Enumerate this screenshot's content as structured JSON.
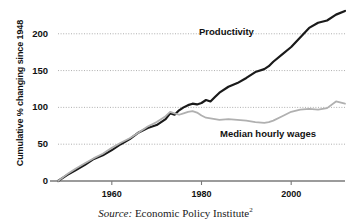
{
  "chart_data": {
    "type": "line",
    "title": "",
    "xlabel": "",
    "ylabel": "Cumulative % changing since 1948",
    "xlim": [
      1948,
      2012
    ],
    "ylim": [
      0,
      235
    ],
    "grid": true,
    "grid_axis": "y",
    "legend_position": "inline-annotation",
    "yticks": [
      0,
      50,
      100,
      150,
      200
    ],
    "ytick_labels": [
      "0",
      "50",
      "100",
      "150",
      "200"
    ],
    "xticks": [
      1960,
      1980,
      2000
    ],
    "xtick_labels": [
      "1960",
      "1980",
      "2000"
    ],
    "series": [
      {
        "name": "Productivity",
        "color": "#1a1a1a",
        "width": 2.2,
        "x": [
          1948,
          1950,
          1952,
          1954,
          1956,
          1958,
          1960,
          1962,
          1964,
          1966,
          1968,
          1970,
          1972,
          1973,
          1974,
          1975,
          1976,
          1977,
          1978,
          1979,
          1980,
          1981,
          1982,
          1983,
          1984,
          1986,
          1988,
          1990,
          1992,
          1994,
          1995,
          1996,
          1998,
          2000,
          2002,
          2004,
          2006,
          2008,
          2010,
          2012
        ],
        "values": [
          0,
          8,
          15,
          22,
          30,
          35,
          42,
          50,
          57,
          66,
          72,
          76,
          84,
          92,
          90,
          96,
          100,
          103,
          105,
          104,
          106,
          110,
          108,
          114,
          120,
          128,
          133,
          140,
          148,
          152,
          156,
          162,
          172,
          182,
          195,
          208,
          215,
          218,
          226,
          231
        ]
      },
      {
        "name": "Median hourly wages",
        "color": "#b0b0b0",
        "width": 1.8,
        "x": [
          1948,
          1950,
          1952,
          1954,
          1956,
          1958,
          1960,
          1962,
          1964,
          1966,
          1968,
          1970,
          1972,
          1973,
          1974,
          1975,
          1976,
          1977,
          1978,
          1979,
          1980,
          1981,
          1982,
          1983,
          1984,
          1986,
          1988,
          1990,
          1992,
          1994,
          1995,
          1996,
          1998,
          2000,
          2002,
          2004,
          2006,
          2008,
          2010,
          2012
        ],
        "values": [
          0,
          9,
          17,
          24,
          31,
          37,
          45,
          52,
          58,
          66,
          74,
          80,
          88,
          94,
          92,
          90,
          92,
          94,
          95,
          93,
          89,
          86,
          85,
          84,
          83,
          84,
          83,
          82,
          80,
          79,
          80,
          82,
          88,
          94,
          97,
          98,
          97,
          99,
          108,
          105
        ]
      }
    ],
    "annotations": [
      {
        "text": "Productivity",
        "x": 1990,
        "y": 205
      },
      {
        "text": "Median hourly wages",
        "x": 1993,
        "y": 62
      }
    ]
  },
  "axis": {
    "y_title": "Cumulative % changing since 1948"
  },
  "source_note": {
    "label": "Source:",
    "text": "Economic Policy Institute",
    "footnote": "2"
  },
  "colors": {
    "productivity": "#1a1a1a",
    "wages": "#b0b0b0",
    "axis": "#7a7a7a",
    "grid": "#9a9a9a",
    "text": "#111111"
  }
}
